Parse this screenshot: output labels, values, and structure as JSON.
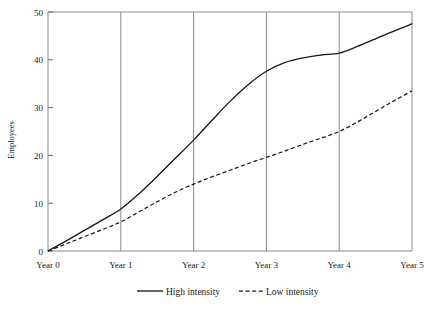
{
  "chart_data": {
    "type": "line",
    "title": "",
    "xlabel": "",
    "ylabel": "Employees",
    "x": [
      0,
      1,
      2,
      3,
      4,
      5
    ],
    "categories": [
      "Year 0",
      "Year 1",
      "Year 2",
      "Year 3",
      "Year 4",
      "Year 5"
    ],
    "xtick_labels": [
      "Year 0",
      "Year 1",
      "Year 2",
      "Year 3",
      "Year 4",
      "Year 5"
    ],
    "ytick_labels": [
      "0",
      "10",
      "20",
      "30",
      "40",
      "50"
    ],
    "ytick_values": [
      0,
      10,
      20,
      30,
      40,
      50
    ],
    "ylim": [
      0,
      50
    ],
    "xlim": [
      0,
      5
    ],
    "grid": "vertical",
    "legend_position": "bottom-center",
    "series": [
      {
        "name": "High intensity",
        "style": "solid",
        "color": "#1a1a1a",
        "values": [
          0,
          8.8,
          23.2,
          37.6,
          41.4,
          47.5
        ],
        "dense_x": [
          0,
          0.25,
          0.5,
          0.75,
          1,
          1.25,
          1.5,
          1.75,
          2,
          2.25,
          2.5,
          2.75,
          3,
          3.25,
          3.5,
          3.75,
          4,
          4.25,
          4.5,
          4.75,
          5
        ],
        "dense_y": [
          0,
          2.1,
          4.3,
          6.5,
          8.8,
          12.0,
          15.6,
          19.4,
          23.2,
          27.3,
          31.3,
          34.8,
          37.6,
          39.4,
          40.4,
          41.0,
          41.4,
          42.8,
          44.4,
          46.0,
          47.5
        ]
      },
      {
        "name": "Low intensity",
        "style": "dashed",
        "color": "#1a1a1a",
        "values": [
          0,
          6.1,
          14.0,
          19.6,
          25.0,
          33.5
        ],
        "dense_x": [
          0,
          0.25,
          0.5,
          0.75,
          1,
          1.25,
          1.5,
          1.75,
          2,
          2.25,
          2.5,
          2.75,
          3,
          3.25,
          3.5,
          3.75,
          4,
          4.25,
          4.5,
          4.75,
          5
        ],
        "dense_y": [
          0,
          1.5,
          3.0,
          4.5,
          6.1,
          8.2,
          10.3,
          12.3,
          14.0,
          15.5,
          16.9,
          18.3,
          19.6,
          20.9,
          22.3,
          23.6,
          25.0,
          27.0,
          29.2,
          31.4,
          33.5
        ]
      }
    ]
  },
  "legend": {
    "items": [
      {
        "label": "High intensity",
        "style": "solid"
      },
      {
        "label": "Low intensity",
        "style": "dashed"
      }
    ]
  },
  "axis": {
    "y_title": "Employees"
  }
}
